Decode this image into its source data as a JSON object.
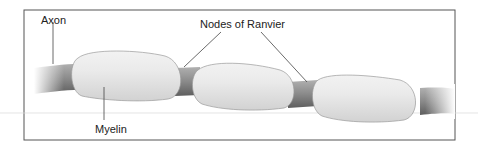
{
  "diagram": {
    "labels": {
      "axon": "Axon",
      "nodes": "Nodes of Ranvier",
      "myelin": "Myelin"
    },
    "colors": {
      "border": "#555555",
      "axon": "#8a8a8a",
      "axon_dark": "#666666",
      "myelin": "#e8e8e8",
      "myelin_edge": "#9a9a9a",
      "leader": "#444444",
      "background": "#ffffff"
    }
  }
}
